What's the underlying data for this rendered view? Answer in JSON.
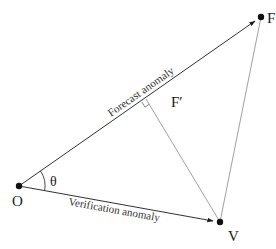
{
  "diagram": {
    "type": "vector-geometry",
    "points": {
      "O": {
        "label": "O",
        "x": 19,
        "y": 186
      },
      "F": {
        "label": "F",
        "x": 261,
        "y": 17
      },
      "V": {
        "label": "V",
        "x": 220,
        "y": 222
      },
      "F_prime": {
        "label": "F′",
        "x": 146,
        "y": 99
      }
    },
    "angle_label": "θ",
    "edges": {
      "forecast": {
        "label": "Forecast anomaly",
        "from": "O",
        "to": "F",
        "arrow": true
      },
      "verification": {
        "label": "Verification anomaly",
        "from": "O",
        "to": "V",
        "arrow": true
      },
      "error": {
        "from": "V",
        "to": "F",
        "arrow": false
      },
      "perpendicular": {
        "from": "V",
        "to": "F_prime",
        "arrow": false,
        "right_angle_marker": true
      }
    },
    "colors": {
      "line": "#1a1a1a",
      "thin_line": "#777777",
      "point": "#111111",
      "text": "#1a1a1a"
    }
  }
}
